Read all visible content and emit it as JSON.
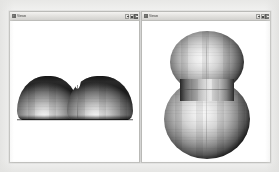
{
  "page": {
    "background_color": "#f2f2f1"
  },
  "windows": [
    {
      "id": "left",
      "title": "Viewer",
      "title_legible": false,
      "icon": "app-window-icon",
      "controls": [
        {
          "name": "minimize-button",
          "label": "_"
        },
        {
          "name": "maximize-button",
          "label": "□"
        },
        {
          "name": "close-button",
          "label": "×"
        }
      ],
      "canvas": {
        "name": "side-view-canvas",
        "background_color": "#ffffff",
        "object": {
          "name": "dumbbell-surface-side-view",
          "description": "Shaded 3D surface, side elevation: two merged rounded lobes with a central notch and a flat base",
          "lobes": 2,
          "shading": "gouraud-grayscale",
          "highlight_color": "#f4f4f4",
          "shadow_color": "#1e1e1e"
        }
      }
    },
    {
      "id": "right",
      "title": "Viewer",
      "title_legible": false,
      "icon": "app-window-icon",
      "controls": [
        {
          "name": "minimize-button",
          "label": "_"
        },
        {
          "name": "maximize-button",
          "label": "□"
        },
        {
          "name": "close-button",
          "label": "×"
        }
      ],
      "canvas": {
        "name": "top-view-canvas",
        "background_color": "#ffffff",
        "object": {
          "name": "dumbbell-surface-top-view",
          "description": "Shaded 3D surface, plan view: peanut outline with a smaller upper lobe, larger lower lobe and a pinched waist",
          "lobes": 2,
          "shading": "gouraud-grayscale",
          "highlight_color": "#f7f7f7",
          "shadow_color": "#1f1f1f"
        }
      }
    }
  ]
}
